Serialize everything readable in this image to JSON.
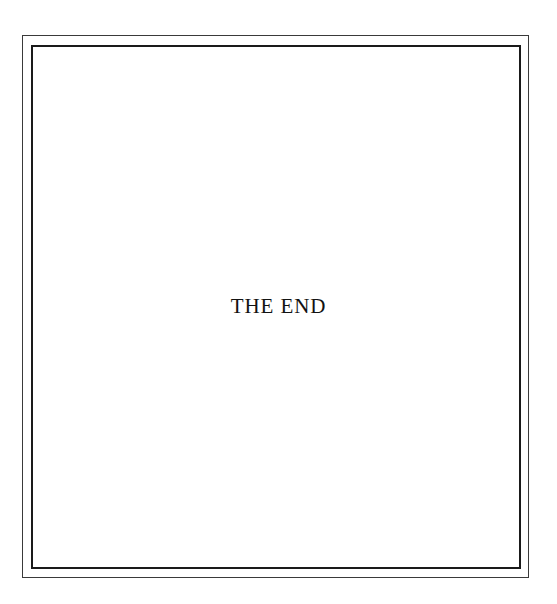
{
  "page": {
    "background_color": "#ffffff",
    "inscription": "THE END"
  },
  "frame": {
    "outer_rule_color": "#3a3a3a",
    "inner_rule_color": "#1a1a1a",
    "style_name": "double-ruled-border"
  }
}
